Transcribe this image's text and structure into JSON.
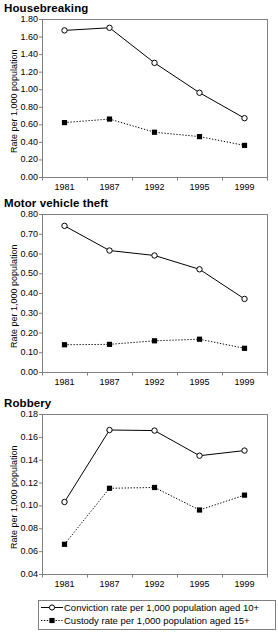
{
  "figure": {
    "y_axis_label": "Rate per 1,000 population",
    "categories": [
      "1981",
      "1987",
      "1992",
      "1995",
      "1999"
    ]
  },
  "legend": {
    "items": [
      {
        "label": "Conviction rate per 1,000 population aged 10+",
        "marker": "open-circle",
        "line": "solid",
        "color": "#000000"
      },
      {
        "label": "Custody rate per 1,000 population aged 15+",
        "marker": "filled-square",
        "line": "dotted",
        "color": "#000000"
      }
    ]
  },
  "chart_data": [
    {
      "type": "line",
      "title": "Housebreaking",
      "xlabel": "",
      "ylabel": "Rate per 1,000 population",
      "categories": [
        "1981",
        "1987",
        "1992",
        "1995",
        "1999"
      ],
      "ylim": [
        0.0,
        1.8
      ],
      "ytick_step": 0.2,
      "ytick_labels": [
        "0.00",
        "0.20",
        "0.40",
        "0.60",
        "0.80",
        "1.00",
        "1.20",
        "1.40",
        "1.60",
        "1.80"
      ],
      "grid": false,
      "legend_position": "below-figure",
      "series": [
        {
          "name": "Conviction rate per 1,000 population aged 10+",
          "values": [
            1.67,
            1.7,
            1.3,
            0.96,
            0.67
          ]
        },
        {
          "name": "Custody rate per 1,000 population aged 15+",
          "values": [
            0.62,
            0.66,
            0.51,
            0.46,
            0.36
          ]
        }
      ]
    },
    {
      "type": "line",
      "title": "Motor vehicle theft",
      "xlabel": "",
      "ylabel": "Rate per 1,000 population",
      "categories": [
        "1981",
        "1987",
        "1992",
        "1995",
        "1999"
      ],
      "ylim": [
        0.0,
        0.8
      ],
      "ytick_step": 0.1,
      "ytick_labels": [
        "0.00",
        "0.10",
        "0.20",
        "0.30",
        "0.40",
        "0.50",
        "0.60",
        "0.70",
        "0.80"
      ],
      "grid": false,
      "legend_position": "below-figure",
      "series": [
        {
          "name": "Conviction rate per 1,000 population aged 10+",
          "values": [
            0.74,
            0.615,
            0.59,
            0.52,
            0.37
          ]
        },
        {
          "name": "Custody rate per 1,000 population aged 15+",
          "values": [
            0.138,
            0.14,
            0.158,
            0.166,
            0.12
          ]
        }
      ]
    },
    {
      "type": "line",
      "title": "Robbery",
      "xlabel": "",
      "ylabel": "Rate per 1,000 population",
      "categories": [
        "1981",
        "1987",
        "1992",
        "1995",
        "1999"
      ],
      "ylim": [
        0.04,
        0.18
      ],
      "ytick_step": 0.02,
      "ytick_labels": [
        "0.04",
        "0.06",
        "0.08",
        "0.10",
        "0.12",
        "0.14",
        "0.16",
        "0.18"
      ],
      "grid": false,
      "legend_position": "below-chart",
      "series": [
        {
          "name": "Conviction rate per 1,000 population aged 10+",
          "values": [
            0.103,
            0.166,
            0.1655,
            0.1435,
            0.148
          ]
        },
        {
          "name": "Custody rate per 1,000 population aged 15+",
          "values": [
            0.066,
            0.115,
            0.1157,
            0.096,
            0.109
          ]
        }
      ]
    }
  ]
}
